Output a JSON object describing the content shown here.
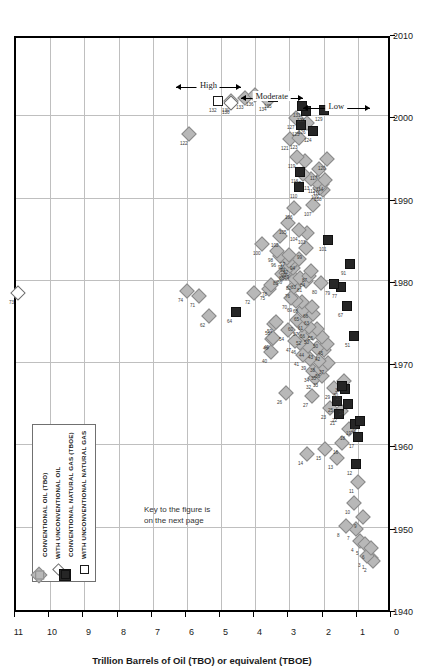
{
  "figure": {
    "note": "Key to the figure is\non the next page",
    "legend": {
      "items": [
        {
          "marker": "filled-diamond-icon",
          "label": "CONVENTIONAL OIL (TBO)"
        },
        {
          "marker": "open-diamond-icon",
          "label": "WITH UNCONVENTIONAL OIL"
        },
        {
          "marker": "filled-square-icon",
          "label": "CONVENTIONAL NATURAL GAS (TBOE)"
        },
        {
          "marker": "open-square-icon",
          "label": "WITH UNCONVENTIONAL NATURAL GAS"
        }
      ]
    },
    "annotations": [
      {
        "label": "High"
      },
      {
        "label": "Moderate"
      },
      {
        "label": "Low"
      }
    ]
  },
  "chart_data": {
    "type": "scatter",
    "title": "",
    "xlabel": "",
    "ylabel": "Trillion Barrels of Oil (TBO) or equivalent (TBOE)",
    "xlim": [
      1940,
      2010
    ],
    "ylim": [
      0,
      11
    ],
    "xticks": [
      1940,
      1950,
      1960,
      1970,
      1980,
      1990,
      2000,
      2010
    ],
    "yticks": [
      0,
      1,
      2,
      3,
      4,
      5,
      6,
      7,
      8,
      9,
      10,
      11
    ],
    "grid": true,
    "legend_position": "top-left",
    "orientation": "rotated-90",
    "series": [
      {
        "name": "CONVENTIONAL OIL (TBO)",
        "marker": "filled-diamond",
        "color": "#b8b8b8",
        "points": [
          {
            "id": "1",
            "x": 1946.3,
            "y": 0.6
          },
          {
            "id": "2",
            "x": 1946.0,
            "y": 0.55
          },
          {
            "id": "3",
            "x": 1946.6,
            "y": 0.72
          },
          {
            "id": "4",
            "x": 1948.4,
            "y": 0.95
          },
          {
            "id": "5",
            "x": 1948.0,
            "y": 0.8
          },
          {
            "id": "6",
            "x": 1947.5,
            "y": 0.62
          },
          {
            "id": "7",
            "x": 1949.8,
            "y": 1.05
          },
          {
            "id": "8",
            "x": 1950.2,
            "y": 1.35
          },
          {
            "id": "9",
            "x": 1951.3,
            "y": 0.85
          },
          {
            "id": "10",
            "x": 1953.0,
            "y": 1.1
          },
          {
            "id": "11",
            "x": 1955.5,
            "y": 1.0
          },
          {
            "id": "13",
            "x": 1958.5,
            "y": 1.6
          },
          {
            "id": "14",
            "x": 1959.0,
            "y": 2.5
          },
          {
            "id": "15",
            "x": 1959.6,
            "y": 1.95
          },
          {
            "id": "16",
            "x": 1960.3,
            "y": 1.45
          },
          {
            "id": "18",
            "x": 1962.0,
            "y": 1.25
          },
          {
            "id": "22",
            "x": 1964.2,
            "y": 1.5
          },
          {
            "id": "23",
            "x": 1964.5,
            "y": 1.82
          },
          {
            "id": "26",
            "x": 1966.4,
            "y": 3.1
          },
          {
            "id": "27",
            "x": 1966.0,
            "y": 2.35
          },
          {
            "id": "29",
            "x": 1967.0,
            "y": 1.7
          },
          {
            "id": "31",
            "x": 1967.8,
            "y": 1.4
          },
          {
            "id": "32",
            "x": 1968.2,
            "y": 2.25
          },
          {
            "id": "33",
            "x": 1968.4,
            "y": 2.05
          },
          {
            "id": "34",
            "x": 1969.0,
            "y": 2.3
          },
          {
            "id": "35",
            "x": 1969.3,
            "y": 2.1
          },
          {
            "id": "36",
            "x": 1969.5,
            "y": 1.98
          },
          {
            "id": "37",
            "x": 1970.0,
            "y": 1.88
          },
          {
            "id": "38",
            "x": 1970.3,
            "y": 2.15
          },
          {
            "id": "39",
            "x": 1970.5,
            "y": 2.4
          },
          {
            "id": "40",
            "x": 1971.3,
            "y": 3.55
          },
          {
            "id": "41",
            "x": 1971.0,
            "y": 2.6
          },
          {
            "id": "42",
            "x": 1971.6,
            "y": 2.0
          },
          {
            "id": "43",
            "x": 1971.9,
            "y": 2.2
          },
          {
            "id": "44",
            "x": 1972.1,
            "y": 2.45
          },
          {
            "id": "45",
            "x": 1972.3,
            "y": 1.9
          },
          {
            "id": "46",
            "x": 1972.5,
            "y": 2.7
          },
          {
            "id": "47",
            "x": 1972.7,
            "y": 2.85
          },
          {
            "id": "48",
            "x": 1972.9,
            "y": 3.52
          },
          {
            "id": "49",
            "x": 1973.0,
            "y": 3.48
          },
          {
            "id": "50",
            "x": 1973.2,
            "y": 2.05
          },
          {
            "id": "52",
            "x": 1973.5,
            "y": 2.55
          },
          {
            "id": "53",
            "x": 1973.7,
            "y": 2.3
          },
          {
            "id": "54",
            "x": 1974.0,
            "y": 3.05
          },
          {
            "id": "55",
            "x": 1974.2,
            "y": 2.18
          },
          {
            "id": "56",
            "x": 1974.4,
            "y": 2.42
          },
          {
            "id": "57",
            "x": 1974.6,
            "y": 2.62
          },
          {
            "id": "58",
            "x": 1974.8,
            "y": 3.45
          },
          {
            "id": "59",
            "x": 1975.0,
            "y": 3.4
          },
          {
            "id": "60",
            "x": 1975.2,
            "y": 2.78
          },
          {
            "id": "61",
            "x": 1975.4,
            "y": 2.5
          },
          {
            "id": "62",
            "x": 1975.7,
            "y": 5.35
          },
          {
            "id": "63",
            "x": 1976.0,
            "y": 2.32
          },
          {
            "id": "65",
            "x": 1976.5,
            "y": 2.6
          },
          {
            "id": "66",
            "x": 1976.8,
            "y": 2.35
          },
          {
            "id": "68",
            "x": 1977.4,
            "y": 2.62
          },
          {
            "id": "69",
            "x": 1977.6,
            "y": 2.8
          },
          {
            "id": "70",
            "x": 1977.9,
            "y": 2.95
          },
          {
            "id": "71",
            "x": 1978.2,
            "y": 5.65
          },
          {
            "id": "72",
            "x": 1978.5,
            "y": 4.05
          },
          {
            "id": "74",
            "x": 1978.8,
            "y": 6.0
          },
          {
            "id": "75",
            "x": 1979.0,
            "y": 3.6
          },
          {
            "id": "76",
            "x": 1979.2,
            "y": 2.88
          },
          {
            "id": "78",
            "x": 1979.5,
            "y": 3.55
          },
          {
            "id": "80",
            "x": 1979.8,
            "y": 2.08
          },
          {
            "id": "81",
            "x": 1980.0,
            "y": 2.52
          },
          {
            "id": "82",
            "x": 1980.2,
            "y": 2.85
          },
          {
            "id": "83",
            "x": 1980.4,
            "y": 2.7
          },
          {
            "id": "84",
            "x": 1980.6,
            "y": 2.42
          },
          {
            "id": "85",
            "x": 1980.8,
            "y": 3.22
          },
          {
            "id": "86",
            "x": 1981.0,
            "y": 3.1
          },
          {
            "id": "87",
            "x": 1981.2,
            "y": 2.38
          },
          {
            "id": "88",
            "x": 1981.4,
            "y": 3.05
          },
          {
            "id": "89",
            "x": 1981.6,
            "y": 2.9
          },
          {
            "id": "90",
            "x": 1981.8,
            "y": 2.98
          },
          {
            "id": "92",
            "x": 1982.2,
            "y": 2.92
          },
          {
            "id": "93",
            "x": 1982.4,
            "y": 3.0
          },
          {
            "id": "94",
            "x": 1982.6,
            "y": 2.72
          },
          {
            "id": "95",
            "x": 1982.8,
            "y": 3.08
          },
          {
            "id": "96",
            "x": 1983.0,
            "y": 3.28
          },
          {
            "id": "97",
            "x": 1983.2,
            "y": 3.02
          },
          {
            "id": "98",
            "x": 1983.6,
            "y": 3.35
          },
          {
            "id": "99",
            "x": 1984.0,
            "y": 2.52
          },
          {
            "id": "100",
            "x": 1984.5,
            "y": 3.8
          },
          {
            "id": "102",
            "x": 1985.4,
            "y": 3.28
          },
          {
            "id": "103",
            "x": 1985.8,
            "y": 2.48
          },
          {
            "id": "104",
            "x": 1986.2,
            "y": 2.72
          },
          {
            "id": "105",
            "x": 1987.0,
            "y": 3.05
          },
          {
            "id": "106",
            "x": 1988.8,
            "y": 2.88
          },
          {
            "id": "107",
            "x": 1989.2,
            "y": 2.3
          },
          {
            "id": "108",
            "x": 1991.0,
            "y": 2.02
          },
          {
            "id": "109",
            "x": 1991.3,
            "y": 2.12
          },
          {
            "id": "111",
            "x": 1991.8,
            "y": 2.05
          },
          {
            "id": "112",
            "x": 1992.0,
            "y": 2.18
          },
          {
            "id": "113",
            "x": 1992.4,
            "y": 2.38
          },
          {
            "id": "114",
            "x": 1992.2,
            "y": 1.95
          },
          {
            "id": "115",
            "x": 1993.0,
            "y": 2.6
          },
          {
            "id": "117",
            "x": 1993.6,
            "y": 2.15
          },
          {
            "id": "118",
            "x": 1994.6,
            "y": 2.55
          },
          {
            "id": "119",
            "x": 1995.0,
            "y": 2.78
          },
          {
            "id": "120",
            "x": 1994.8,
            "y": 1.9
          },
          {
            "id": "121",
            "x": 1997.2,
            "y": 2.98
          },
          {
            "id": "122",
            "x": 1997.8,
            "y": 5.95
          },
          {
            "id": "123",
            "x": 1997.4,
            "y": 2.72
          },
          {
            "id": "126",
            "x": 1999.2,
            "y": 2.48
          },
          {
            "id": "127",
            "x": 1999.8,
            "y": 2.82
          },
          {
            "id": "130",
            "x": 2001.8,
            "y": 4.72
          },
          {
            "id": "133",
            "x": 2002.2,
            "y": 4.3
          },
          {
            "id": "134",
            "x": 2002.0,
            "y": 3.62
          },
          {
            "id": "136",
            "x": 2002.6,
            "y": 4.02
          }
        ]
      },
      {
        "name": "WITH UNCONVENTIONAL OIL",
        "marker": "open-diamond",
        "color": "#ffffff",
        "points": [
          {
            "id": "73",
            "x": 1978.5,
            "y": 10.95
          },
          {
            "id": "130",
            "x": 2001.6,
            "y": 4.7
          }
        ]
      },
      {
        "name": "CONVENTIONAL NATURAL GAS (TBOE)",
        "marker": "filled-square",
        "color": "#262626",
        "points": [
          {
            "id": "12",
            "x": 1957.8,
            "y": 1.05
          },
          {
            "id": "17",
            "x": 1961.0,
            "y": 1.0
          },
          {
            "id": "19",
            "x": 1962.6,
            "y": 1.08
          },
          {
            "id": "20",
            "x": 1963.0,
            "y": 0.95
          },
          {
            "id": "21",
            "x": 1963.8,
            "y": 1.55
          },
          {
            "id": "24",
            "x": 1965.0,
            "y": 1.28
          },
          {
            "id": "25",
            "x": 1965.4,
            "y": 1.6
          },
          {
            "id": "28",
            "x": 1966.8,
            "y": 1.38
          },
          {
            "id": "30",
            "x": 1967.2,
            "y": 1.45
          },
          {
            "id": "51",
            "x": 1973.3,
            "y": 1.1
          },
          {
            "id": "64",
            "x": 1976.2,
            "y": 4.55
          },
          {
            "id": "67",
            "x": 1977.0,
            "y": 1.32
          },
          {
            "id": "77",
            "x": 1979.3,
            "y": 1.48
          },
          {
            "id": "79",
            "x": 1979.6,
            "y": 1.7
          },
          {
            "id": "91",
            "x": 1982.0,
            "y": 1.22
          },
          {
            "id": "101",
            "x": 1985.0,
            "y": 1.88
          },
          {
            "id": "110",
            "x": 1991.4,
            "y": 2.72
          },
          {
            "id": "116",
            "x": 1993.2,
            "y": 2.7
          },
          {
            "id": "124",
            "x": 1998.2,
            "y": 2.32
          },
          {
            "id": "125",
            "x": 1999.0,
            "y": 2.65
          },
          {
            "id": "128",
            "x": 2000.6,
            "y": 2.52
          },
          {
            "id": "129",
            "x": 2000.8,
            "y": 2.0
          },
          {
            "id": "131",
            "x": 2001.2,
            "y": 2.62
          },
          {
            "id": "135",
            "x": 2002.4,
            "y": 3.48
          }
        ]
      },
      {
        "name": "WITH UNCONVENTIONAL NATURAL GAS",
        "marker": "open-square",
        "color": "#ffffff",
        "points": [
          {
            "id": "132",
            "x": 2001.8,
            "y": 5.1
          }
        ]
      }
    ]
  }
}
